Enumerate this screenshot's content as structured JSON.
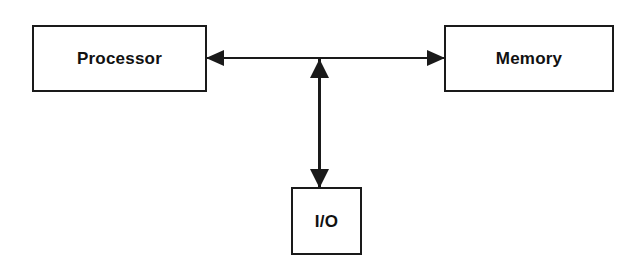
{
  "diagram": {
    "background_color": "#ffffff",
    "stroke_color": "#1a1a1a",
    "nodes": [
      {
        "id": "processor",
        "label": "Processor",
        "shape": "rectangle",
        "x": 32,
        "y": 25,
        "width": 175,
        "height": 67
      },
      {
        "id": "memory",
        "label": "Memory",
        "shape": "rectangle",
        "x": 444,
        "y": 25,
        "width": 170,
        "height": 67
      },
      {
        "id": "io",
        "label": "I/O",
        "shape": "rectangle",
        "x": 291,
        "y": 187,
        "width": 71,
        "height": 68
      }
    ],
    "edges": [
      {
        "id": "processor-memory",
        "from": "processor",
        "to": "memory",
        "direction": "bidirectional",
        "orientation": "horizontal",
        "label": ""
      },
      {
        "id": "bus-io",
        "from": "bus",
        "to": "io",
        "direction": "bidirectional",
        "orientation": "vertical",
        "label": ""
      }
    ],
    "junction": {
      "x": 319,
      "y": 58
    }
  }
}
